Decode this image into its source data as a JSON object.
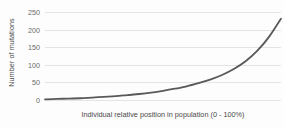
{
  "chart_data": {
    "type": "line",
    "title": "",
    "xlabel": "Individual relative position in population (0 - 100%)",
    "ylabel": "Number of mutations",
    "xlim": [
      0,
      100
    ],
    "ylim": [
      0,
      250
    ],
    "ytick_labels": [
      "250",
      "200",
      "150",
      "100",
      "50",
      "0"
    ],
    "yticks": [
      250,
      200,
      150,
      100,
      50,
      0
    ],
    "xtick_labels": [],
    "grid": "horizontal",
    "legend": "none",
    "line_color": "#595959",
    "line_width": 1.8,
    "background_color": "#fdfdfd",
    "gridline_color": "#e4e4e4",
    "series": [
      {
        "name": "mutations",
        "x": [
          0,
          5,
          10,
          15,
          20,
          25,
          30,
          35,
          40,
          45,
          50,
          55,
          60,
          65,
          70,
          75,
          80,
          85,
          90,
          95,
          100
        ],
        "values": [
          2,
          3,
          4,
          5,
          7,
          9,
          11,
          14,
          17,
          21,
          26,
          32,
          39,
          48,
          58,
          71,
          88,
          110,
          140,
          180,
          231
        ]
      }
    ]
  }
}
